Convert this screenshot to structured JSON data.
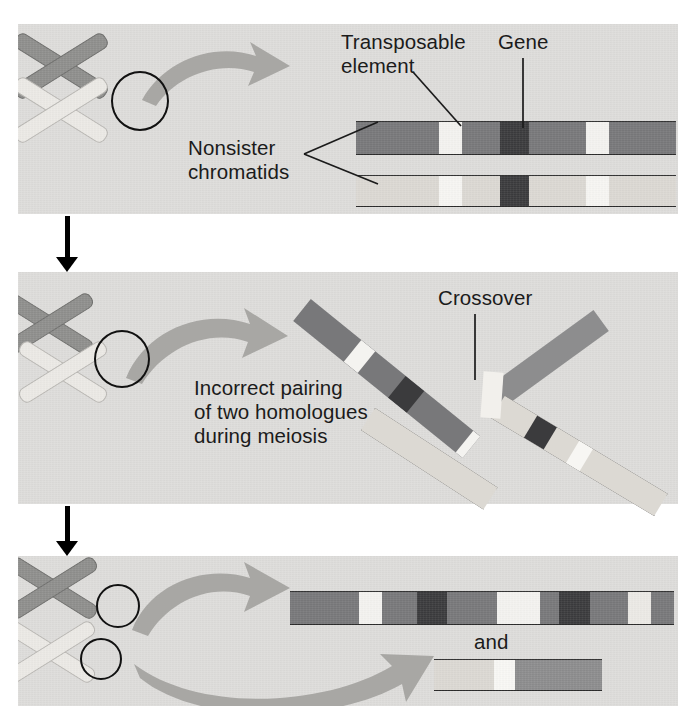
{
  "figure": {
    "background_color": "#ffffff",
    "panel_color": "#dedddb"
  },
  "colors": {
    "chromatid_dark": "#78787a",
    "chromatid_light": "#dcd9d3",
    "gene_band": "#3b3b3d",
    "transposable_band": "#f4f3f0",
    "mid_gray": "#8d8d8e",
    "outline": "#2b2b2b",
    "arrow_gray": "#a8a7a4",
    "flow_arrow": "#000000"
  },
  "panels": [
    {
      "id": "panel-1",
      "name": "nonsister-chromatids-panel",
      "labels": [
        {
          "id": "transposable-element",
          "text": "Transposable\nelement"
        },
        {
          "id": "gene",
          "text": "Gene"
        },
        {
          "id": "nonsister-chromatids",
          "text": "Nonsister\nchromatids"
        }
      ],
      "chromatids": [
        {
          "id": "upper-chromatid",
          "shade": "dark",
          "bands": [
            {
              "type": "transposable",
              "start": 26,
              "width": 7
            },
            {
              "type": "gene",
              "start": 45,
              "width": 9
            },
            {
              "type": "transposable",
              "start": 72,
              "width": 7
            }
          ]
        },
        {
          "id": "lower-chromatid",
          "shade": "light",
          "bands": [
            {
              "type": "transposable",
              "start": 26,
              "width": 7
            },
            {
              "type": "gene",
              "start": 45,
              "width": 9
            },
            {
              "type": "transposable",
              "start": 72,
              "width": 7
            }
          ]
        }
      ]
    },
    {
      "id": "panel-2",
      "name": "incorrect-pairing-panel",
      "labels": [
        {
          "id": "crossover",
          "text": "Crossover"
        },
        {
          "id": "incorrect-pairing",
          "text": "Incorrect pairing\nof two homologues\nduring meiosis"
        }
      ]
    },
    {
      "id": "panel-3",
      "name": "recombinant-products-panel",
      "labels": [
        {
          "id": "and-connector",
          "text": "and"
        }
      ],
      "chromatids": [
        {
          "id": "long-recombinant",
          "shade": "dark",
          "bands": [
            {
              "type": "transposable",
              "start": 18,
              "width": 6
            },
            {
              "type": "gene",
              "start": 33,
              "width": 8
            },
            {
              "type": "transposable",
              "start": 54,
              "width": 11
            },
            {
              "type": "gene",
              "start": 70,
              "width": 8
            },
            {
              "type": "transposable",
              "start": 88,
              "width": 6
            }
          ]
        },
        {
          "id": "short-recombinant",
          "shade": "light",
          "bands": [
            {
              "type": "transposable",
              "start": 36,
              "width": 12
            },
            {
              "type": "dark-segment",
              "start": 48,
              "width": 52
            }
          ]
        }
      ]
    }
  ],
  "flow_arrows": [
    {
      "id": "flow-arrow-1",
      "direction": "down"
    },
    {
      "id": "flow-arrow-2",
      "direction": "down"
    }
  ]
}
